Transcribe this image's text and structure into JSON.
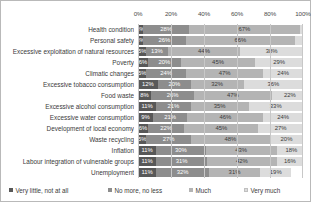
{
  "chart_data": {
    "type": "bar",
    "subtype": "100% stacked horizontal bar",
    "title": "",
    "xlabel": "",
    "ylabel": "",
    "xlim": [
      0,
      100
    ],
    "xticks": [
      "0%",
      "20%",
      "40%",
      "60%",
      "80%",
      "100%"
    ],
    "xtick_values": [
      0,
      20,
      40,
      60,
      80,
      100
    ],
    "grid": true,
    "legend_position": "bottom",
    "categories": [
      "Health condition",
      "Personal safety",
      "Excessive exploitation of natural resources",
      "Poverty",
      "Climatic changes",
      "Excessive tobacco consumption",
      "Food waste",
      "Excessive alcohol consumption",
      "Excessive water consumption",
      "Development of local economy",
      "Waste recycling",
      "Inflation",
      "Labour integration of vulnerable groups",
      "Unemployment"
    ],
    "series": [
      {
        "name": "Very little, not at all",
        "color": "#585858",
        "values": [
          3,
          3,
          5,
          6,
          5,
          12,
          8,
          11,
          9,
          6,
          5,
          11,
          11,
          11
        ],
        "labels": [
          "3%",
          "3%",
          "5%",
          "6%",
          "5%",
          "12%",
          "8%",
          "11%",
          "9%",
          "6%",
          "5%",
          "11%",
          "11%",
          "11%"
        ]
      },
      {
        "name": "No more, no less",
        "color": "#8d8d8d",
        "values": [
          28,
          26,
          13,
          20,
          24,
          20,
          26,
          21,
          21,
          22,
          27,
          30,
          31,
          32
        ],
        "labels": [
          "28%",
          "26%",
          "13%",
          "20%",
          "24%",
          "20%",
          "26%",
          "21%",
          "21%",
          "22%",
          "27%",
          "30%",
          "31%",
          "32%"
        ]
      },
      {
        "name": "Much",
        "color": "#b4b4b4",
        "values": [
          67,
          66,
          44,
          45,
          47,
          32,
          47,
          35,
          46,
          45,
          48,
          43,
          42,
          31
        ],
        "labels": [
          "67%",
          "66%",
          "44%",
          "45%",
          "47%",
          "32%",
          "47%",
          "35%",
          "46%",
          "45%",
          "48%",
          "43%",
          "42%",
          "31%"
        ]
      },
      {
        "name": "Very much",
        "color": "#dcdcdc",
        "values": [
          2,
          5,
          38,
          29,
          24,
          36,
          22,
          33,
          24,
          27,
          20,
          18,
          16,
          19
        ],
        "labels": [
          "",
          "",
          "38%",
          "29%",
          "24%",
          "36%",
          "22%",
          "33%",
          "24%",
          "27%",
          "20%",
          "18%",
          "16%",
          "19%"
        ]
      }
    ]
  }
}
